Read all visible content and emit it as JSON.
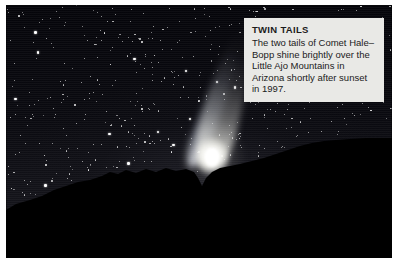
{
  "photo": {
    "subject": "Comet Hale-Bopp over the Little Ajo Mountains",
    "scene_description": "Night sky starfield with a bright comet showing two tails above a dark mountain silhouette",
    "colors": {
      "sky_top": "#05050a",
      "sky_horizon": "#17171d",
      "mountain": "#000000",
      "comet": "#ffffff",
      "caption_background": "#e9e9e6",
      "caption_text": "#1b1b1b",
      "page_background": "#ffffff"
    }
  },
  "caption": {
    "title": "TWIN TAILS",
    "body": "The two tails of Comet Hale–Bopp shine brightly over the Little Ajo Mountains in Arizona shortly after sunset in 1997."
  },
  "features": {
    "dust_tail_label": "dust-tail",
    "ion_tail_label": "ion-tail",
    "coma_label": "coma",
    "nucleus_label": "nucleus",
    "starfield_label": "starfield",
    "ridge_label": "mountain-ridge"
  }
}
